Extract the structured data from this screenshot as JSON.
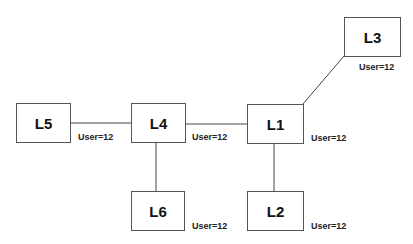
{
  "diagram": {
    "nodes": [
      {
        "id": "L1",
        "label": "L1",
        "user": "User=12"
      },
      {
        "id": "L2",
        "label": "L2",
        "user": "User=12"
      },
      {
        "id": "L3",
        "label": "L3",
        "user": "User=12"
      },
      {
        "id": "L4",
        "label": "L4",
        "user": "User=12"
      },
      {
        "id": "L5",
        "label": "L5",
        "user": "User=12"
      },
      {
        "id": "L6",
        "label": "L6",
        "user": "User=12"
      }
    ],
    "edges": [
      {
        "from": "L5",
        "to": "L4"
      },
      {
        "from": "L4",
        "to": "L1"
      },
      {
        "from": "L1",
        "to": "L3"
      },
      {
        "from": "L4",
        "to": "L6"
      },
      {
        "from": "L1",
        "to": "L2"
      }
    ],
    "line_color": "#444444"
  }
}
